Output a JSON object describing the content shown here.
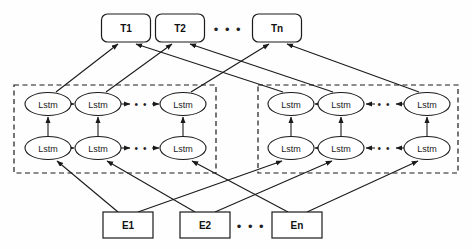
{
  "figure": {
    "type": "diagram"
  },
  "colors": {
    "stroke": "#1a1a1a",
    "fill": "#ffffff",
    "background": "#fefefe"
  },
  "outputs": {
    "label": "output layer",
    "nodes": [
      {
        "id": "t1",
        "label": "T1",
        "x": 126,
        "y": 28
      },
      {
        "id": "t2",
        "label": "T2",
        "x": 180,
        "y": 28
      },
      {
        "id": "tn",
        "label": "Tn",
        "x": 277,
        "y": 28
      }
    ],
    "ellipsis": {
      "label": "• • •",
      "x": 228,
      "y": 29
    }
  },
  "inputs": {
    "label": "input embedding layer",
    "nodes": [
      {
        "id": "e1",
        "label": "E1",
        "x": 128,
        "y": 225
      },
      {
        "id": "e2",
        "label": "E2",
        "x": 205,
        "y": 225
      },
      {
        "id": "en",
        "label": "En",
        "x": 297,
        "y": 225
      }
    ],
    "ellipsis": {
      "label": "• • •",
      "x": 251,
      "y": 226
    }
  },
  "forward_block": {
    "label": "forward LSTM block",
    "direction": "left-to-right",
    "box": {
      "x": 14,
      "y": 85,
      "width": 202,
      "height": 88
    },
    "upper_row": [
      {
        "id": "fwd-u1",
        "label": "Lstm",
        "x": 48,
        "y": 104
      },
      {
        "id": "fwd-u2",
        "label": "Lstm",
        "x": 98,
        "y": 104
      },
      {
        "id": "fwd-u3",
        "label": "Lstm",
        "x": 183,
        "y": 104
      }
    ],
    "lower_row": [
      {
        "id": "fwd-l1",
        "label": "Lstm",
        "x": 48,
        "y": 148
      },
      {
        "id": "fwd-l2",
        "label": "Lstm",
        "x": 98,
        "y": 148
      },
      {
        "id": "fwd-l3",
        "label": "Lstm",
        "x": 183,
        "y": 148
      }
    ],
    "upper_ellipsis": {
      "label": "• •",
      "x": 141,
      "y": 104
    },
    "lower_ellipsis": {
      "label": "• •",
      "x": 141,
      "y": 148
    }
  },
  "backward_block": {
    "label": "backward LSTM block",
    "direction": "right-to-left",
    "box": {
      "x": 258,
      "y": 85,
      "width": 200,
      "height": 88
    },
    "upper_row": [
      {
        "id": "bwd-u1",
        "label": "Lstm",
        "x": 291,
        "y": 104
      },
      {
        "id": "bwd-u2",
        "label": "Lstm",
        "x": 341,
        "y": 104
      },
      {
        "id": "bwd-u3",
        "label": "Lstm",
        "x": 427,
        "y": 104
      }
    ],
    "lower_row": [
      {
        "id": "bwd-l1",
        "label": "Lstm",
        "x": 291,
        "y": 148
      },
      {
        "id": "bwd-l2",
        "label": "Lstm",
        "x": 341,
        "y": 148
      },
      {
        "id": "bwd-l3",
        "label": "Lstm",
        "x": 427,
        "y": 148
      }
    ],
    "upper_ellipsis": {
      "label": "• •",
      "x": 384,
      "y": 104
    },
    "lower_ellipsis": {
      "label": "• •",
      "x": 384,
      "y": 148
    }
  },
  "node_geometry": {
    "ellipse_rx": 23,
    "ellipse_ry": 11.5,
    "out_box_w": 49,
    "out_box_h": 28,
    "out_box_r": 6,
    "in_box_w": 50,
    "in_box_h": 26
  }
}
